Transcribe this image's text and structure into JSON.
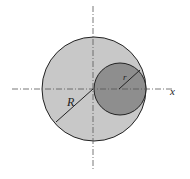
{
  "diagram": {
    "labels": {
      "big_radius": "R",
      "small_radius": "r",
      "x_axis": "x"
    },
    "colors": {
      "big_circle_fill": "#c8c8c8",
      "small_circle_fill": "#8e8e8e",
      "stroke": "#222222",
      "axis": "#555555"
    }
  }
}
